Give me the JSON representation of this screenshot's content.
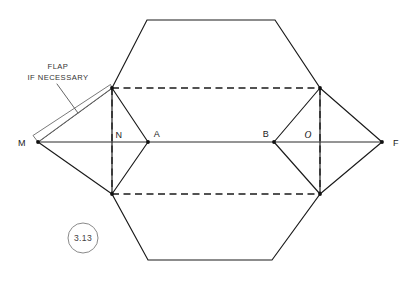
{
  "figure": {
    "callout_number": "3.13",
    "note_line_1": "FLAP",
    "note_line_2": "IF NECESSARY",
    "colors": {
      "solid_stroke": "#1a1a1a",
      "dashed_stroke": "#1a1a1a",
      "flap_stroke": "#6a6a6a",
      "callout_stroke": "#8a8a8a",
      "background": "#ffffff"
    },
    "vertex_labels": {
      "m": "M",
      "n": "N",
      "a": "A",
      "b": "B",
      "o": "O",
      "f": "F"
    },
    "geometry": {
      "centerline_y": 142,
      "m_point": [
        38,
        142
      ],
      "f_point": [
        382,
        142
      ],
      "a_point": [
        148,
        142
      ],
      "b_point": [
        274,
        142
      ],
      "dashed_rect": [
        [
          112,
          88
        ],
        [
          320,
          88
        ],
        [
          320,
          194
        ],
        [
          112,
          194
        ]
      ],
      "hex_top_edge": [
        [
          147,
          20
        ],
        [
          275,
          20
        ]
      ],
      "hex_bottom_edge": [
        [
          148,
          260
        ],
        [
          272,
          260
        ]
      ]
    }
  }
}
